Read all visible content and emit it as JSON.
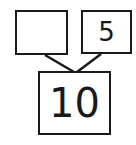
{
  "number_bond": {
    "part_left": "",
    "part_right": "5",
    "whole": "10"
  },
  "colors": {
    "stroke": "#1a1a1a",
    "background": "#ffffff"
  }
}
